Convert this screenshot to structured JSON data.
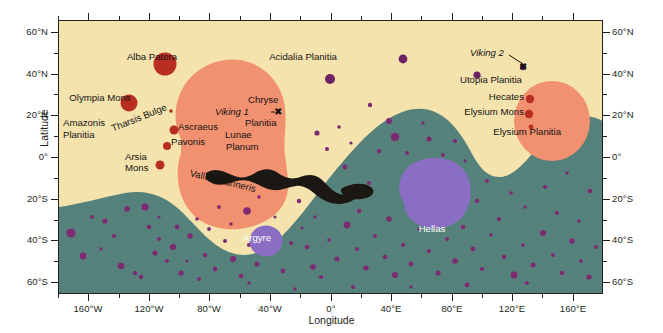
{
  "figure": {
    "xlabel": "Longitude",
    "ylabel": "Latitude"
  },
  "axes": {
    "latitude_ticks": [
      "60°N",
      "40°N",
      "20°N",
      "0°",
      "20°S",
      "40°S",
      "60°S"
    ],
    "longitude_ticks": [
      "160°W",
      "120°W",
      "80°W",
      "40°W",
      "0°",
      "40°E",
      "80°E",
      "120°E",
      "160°E"
    ],
    "xlim": [
      -180,
      180
    ],
    "ylim": [
      -72,
      72
    ]
  },
  "colors": {
    "lowland_plains": "#f5e3ad",
    "southern_highlands": "#53807a",
    "volcanic_province": "#f2916f",
    "volcano": "#b92d22",
    "impact_basin": "#8a6ec4",
    "crater": "#7e2a72",
    "canyon": "#1b1712",
    "frame": "#231f20"
  },
  "labels": [
    {
      "name": "alba-patera",
      "text": "Alba Patera",
      "x": 152,
      "y": 57,
      "style": "plain"
    },
    {
      "name": "acidalia-planitia",
      "text": "Acidalia Planitia",
      "x": 303,
      "y": 57,
      "style": "plain"
    },
    {
      "name": "olympia-mons",
      "text": "Olympia Mons",
      "x": 100,
      "y": 98,
      "style": "plain"
    },
    {
      "name": "amazonis-planitia",
      "text": "Amazonis",
      "x": 63,
      "y": 123,
      "style": "plain"
    },
    {
      "name": "amazonis-planitia-2",
      "text": "Planitia",
      "x": 63,
      "y": 134,
      "style": "plain"
    },
    {
      "name": "tharsis-bulge",
      "text": "Tharsis Bulge",
      "x": 112,
      "y": 122,
      "style": "rot"
    },
    {
      "name": "ascraeus-mons",
      "text": "Ascraeus",
      "x": 178,
      "y": 126,
      "style": "plain"
    },
    {
      "name": "pavonis-mons",
      "text": "Pavonis",
      "x": 171,
      "y": 141,
      "style": "plain"
    },
    {
      "name": "arsia-mons",
      "text": "Arsia",
      "x": 125,
      "y": 155,
      "style": "plain"
    },
    {
      "name": "arsia-mons-2",
      "text": "Mons",
      "x": 125,
      "y": 166,
      "style": "plain"
    },
    {
      "name": "valles-marineris",
      "text": "Valles Marineris",
      "x": 190,
      "y": 170,
      "style": "rot2"
    },
    {
      "name": "chryse-planitia",
      "text": "Chryse",
      "x": 248,
      "y": 99,
      "style": "plain"
    },
    {
      "name": "viking-1",
      "text": "Viking 1",
      "x": 215,
      "y": 112,
      "style": "ital"
    },
    {
      "name": "chryse-planitia-2",
      "text": "Planitia",
      "x": 245,
      "y": 122,
      "style": "plain"
    },
    {
      "name": "lunae-planum",
      "text": "Lunae",
      "x": 225,
      "y": 131,
      "style": "plain"
    },
    {
      "name": "lunae-planum-2",
      "text": "Planum",
      "x": 226,
      "y": 143,
      "style": "plain"
    },
    {
      "name": "viking-2",
      "text": "Viking 2",
      "x": 470,
      "y": 52,
      "style": "ital"
    },
    {
      "name": "utopia-planitia",
      "text": "Utopia Planitia",
      "x": 460,
      "y": 79,
      "style": "plain"
    },
    {
      "name": "hecates-tholus",
      "text": "Hecates",
      "x": 524,
      "y": 96,
      "style": "plain"
    },
    {
      "name": "elysium-mons",
      "text": "Elysium Mons",
      "x": 504,
      "y": 110,
      "style": "plain"
    },
    {
      "name": "elysium-planitia",
      "text": "Elysium Planitia",
      "x": 511,
      "y": 130,
      "style": "plain"
    },
    {
      "name": "argyre-basin",
      "text": "Argyre",
      "x": 257,
      "y": 236,
      "style": "white"
    },
    {
      "name": "hellas-basin",
      "text": "Hellas",
      "x": 432,
      "y": 227,
      "style": "white"
    }
  ],
  "landers": [
    {
      "name": "viking-1-marker",
      "glyph": "✖",
      "x": 276,
      "y": 107
    },
    {
      "name": "viking-2-marker",
      "glyph": "✖",
      "x": 521,
      "y": 66
    }
  ],
  "map_data": {
    "type": "map",
    "projection": "cylindrical",
    "highland_boundary_note": "dichotomy boundary separating northern lowland plains from southern cratered highlands",
    "volcanoes": [
      {
        "name": "Alba Patera",
        "lon": -110,
        "lat": 40,
        "r": 11.5
      },
      {
        "name": "Olympia Mons",
        "lon": -134,
        "lat": 18,
        "r": 8.5
      },
      {
        "name": "Ascraeus Mons",
        "lon": -104,
        "lat": 11,
        "r": 4.5
      },
      {
        "name": "Pavonis Mons",
        "lon": -113,
        "lat": 1,
        "r": 4.0
      },
      {
        "name": "Arsia Mons",
        "lon": -120,
        "lat": -9,
        "r": 4.5
      },
      {
        "name": "Tharsis minor",
        "lon": -108,
        "lat": 21,
        "r": 1.8
      },
      {
        "name": "Hecates Tholus",
        "lon": 150,
        "lat": 32,
        "r": 4.2
      },
      {
        "name": "Elysium Mons",
        "lon": 147,
        "lat": 25,
        "r": 4.2
      },
      {
        "name": "Albor Tholus",
        "lon": 150,
        "lat": 19,
        "r": 2.4
      }
    ],
    "basins": [
      {
        "name": "Hellas",
        "lon": 70,
        "lat": -42,
        "r": 27
      },
      {
        "name": "Argyre",
        "lon": -43,
        "lat": -50,
        "r": 16
      }
    ]
  }
}
